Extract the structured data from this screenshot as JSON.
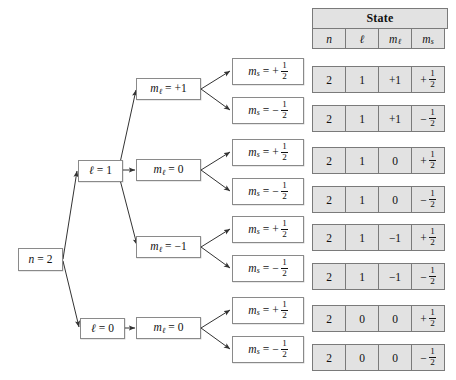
{
  "figure": {
    "colors": {
      "node_border": "#8a8a8a",
      "node_fill": "#ffffff",
      "table_fill": "#e2e2e2",
      "table_border": "#7a7a7a",
      "line": "#333333",
      "text": "#111111"
    }
  },
  "tree": {
    "root": {
      "label": "n = 2",
      "var": "n",
      "value": "2"
    },
    "level_l": [
      {
        "label": "ℓ = 1",
        "var": "ℓ",
        "value": "1"
      },
      {
        "label": "ℓ = 0",
        "var": "ℓ",
        "value": "0"
      }
    ],
    "level_ml": [
      {
        "label": "mℓ = +1",
        "var": "m",
        "sub": "ℓ",
        "value": "+1"
      },
      {
        "label": "mℓ = 0",
        "var": "m",
        "sub": "ℓ",
        "value": "0"
      },
      {
        "label": "mℓ = −1",
        "var": "m",
        "sub": "ℓ",
        "value": "−1"
      },
      {
        "label": "mℓ = 0",
        "var": "m",
        "sub": "ℓ",
        "value": "0"
      }
    ],
    "level_ms": [
      {
        "label": "ms = + 1/2",
        "var": "m",
        "sub": "s",
        "sign": "+",
        "num": "1",
        "den": "2"
      },
      {
        "label": "ms = − 1/2",
        "var": "m",
        "sub": "s",
        "sign": "−",
        "num": "1",
        "den": "2"
      },
      {
        "label": "ms = + 1/2",
        "var": "m",
        "sub": "s",
        "sign": "+",
        "num": "1",
        "den": "2"
      },
      {
        "label": "ms = − 1/2",
        "var": "m",
        "sub": "s",
        "sign": "−",
        "num": "1",
        "den": "2"
      },
      {
        "label": "ms = + 1/2",
        "var": "m",
        "sub": "s",
        "sign": "+",
        "num": "1",
        "den": "2"
      },
      {
        "label": "ms = − 1/2",
        "var": "m",
        "sub": "s",
        "sign": "−",
        "num": "1",
        "den": "2"
      },
      {
        "label": "ms = + 1/2",
        "var": "m",
        "sub": "s",
        "sign": "+",
        "num": "1",
        "den": "2"
      },
      {
        "label": "ms = − 1/2",
        "var": "m",
        "sub": "s",
        "sign": "−",
        "num": "1",
        "den": "2"
      }
    ]
  },
  "table": {
    "title": "State",
    "columns": [
      {
        "var": "n",
        "sub": ""
      },
      {
        "var": "ℓ",
        "sub": ""
      },
      {
        "var": "m",
        "sub": "ℓ"
      },
      {
        "var": "m",
        "sub": "s"
      }
    ],
    "rows": [
      {
        "n": "2",
        "l": "1",
        "ml": "+1",
        "ms_sign": "+",
        "ms_num": "1",
        "ms_den": "2"
      },
      {
        "n": "2",
        "l": "1",
        "ml": "+1",
        "ms_sign": "−",
        "ms_num": "1",
        "ms_den": "2"
      },
      {
        "n": "2",
        "l": "1",
        "ml": "0",
        "ms_sign": "+",
        "ms_num": "1",
        "ms_den": "2"
      },
      {
        "n": "2",
        "l": "1",
        "ml": "0",
        "ms_sign": "−",
        "ms_num": "1",
        "ms_den": "2"
      },
      {
        "n": "2",
        "l": "1",
        "ml": "−1",
        "ms_sign": "+",
        "ms_num": "1",
        "ms_den": "2"
      },
      {
        "n": "2",
        "l": "1",
        "ml": "−1",
        "ms_sign": "−",
        "ms_num": "1",
        "ms_den": "2"
      },
      {
        "n": "2",
        "l": "0",
        "ml": "0",
        "ms_sign": "+",
        "ms_num": "1",
        "ms_den": "2"
      },
      {
        "n": "2",
        "l": "0",
        "ml": "0",
        "ms_sign": "−",
        "ms_num": "1",
        "ms_den": "2"
      }
    ]
  }
}
